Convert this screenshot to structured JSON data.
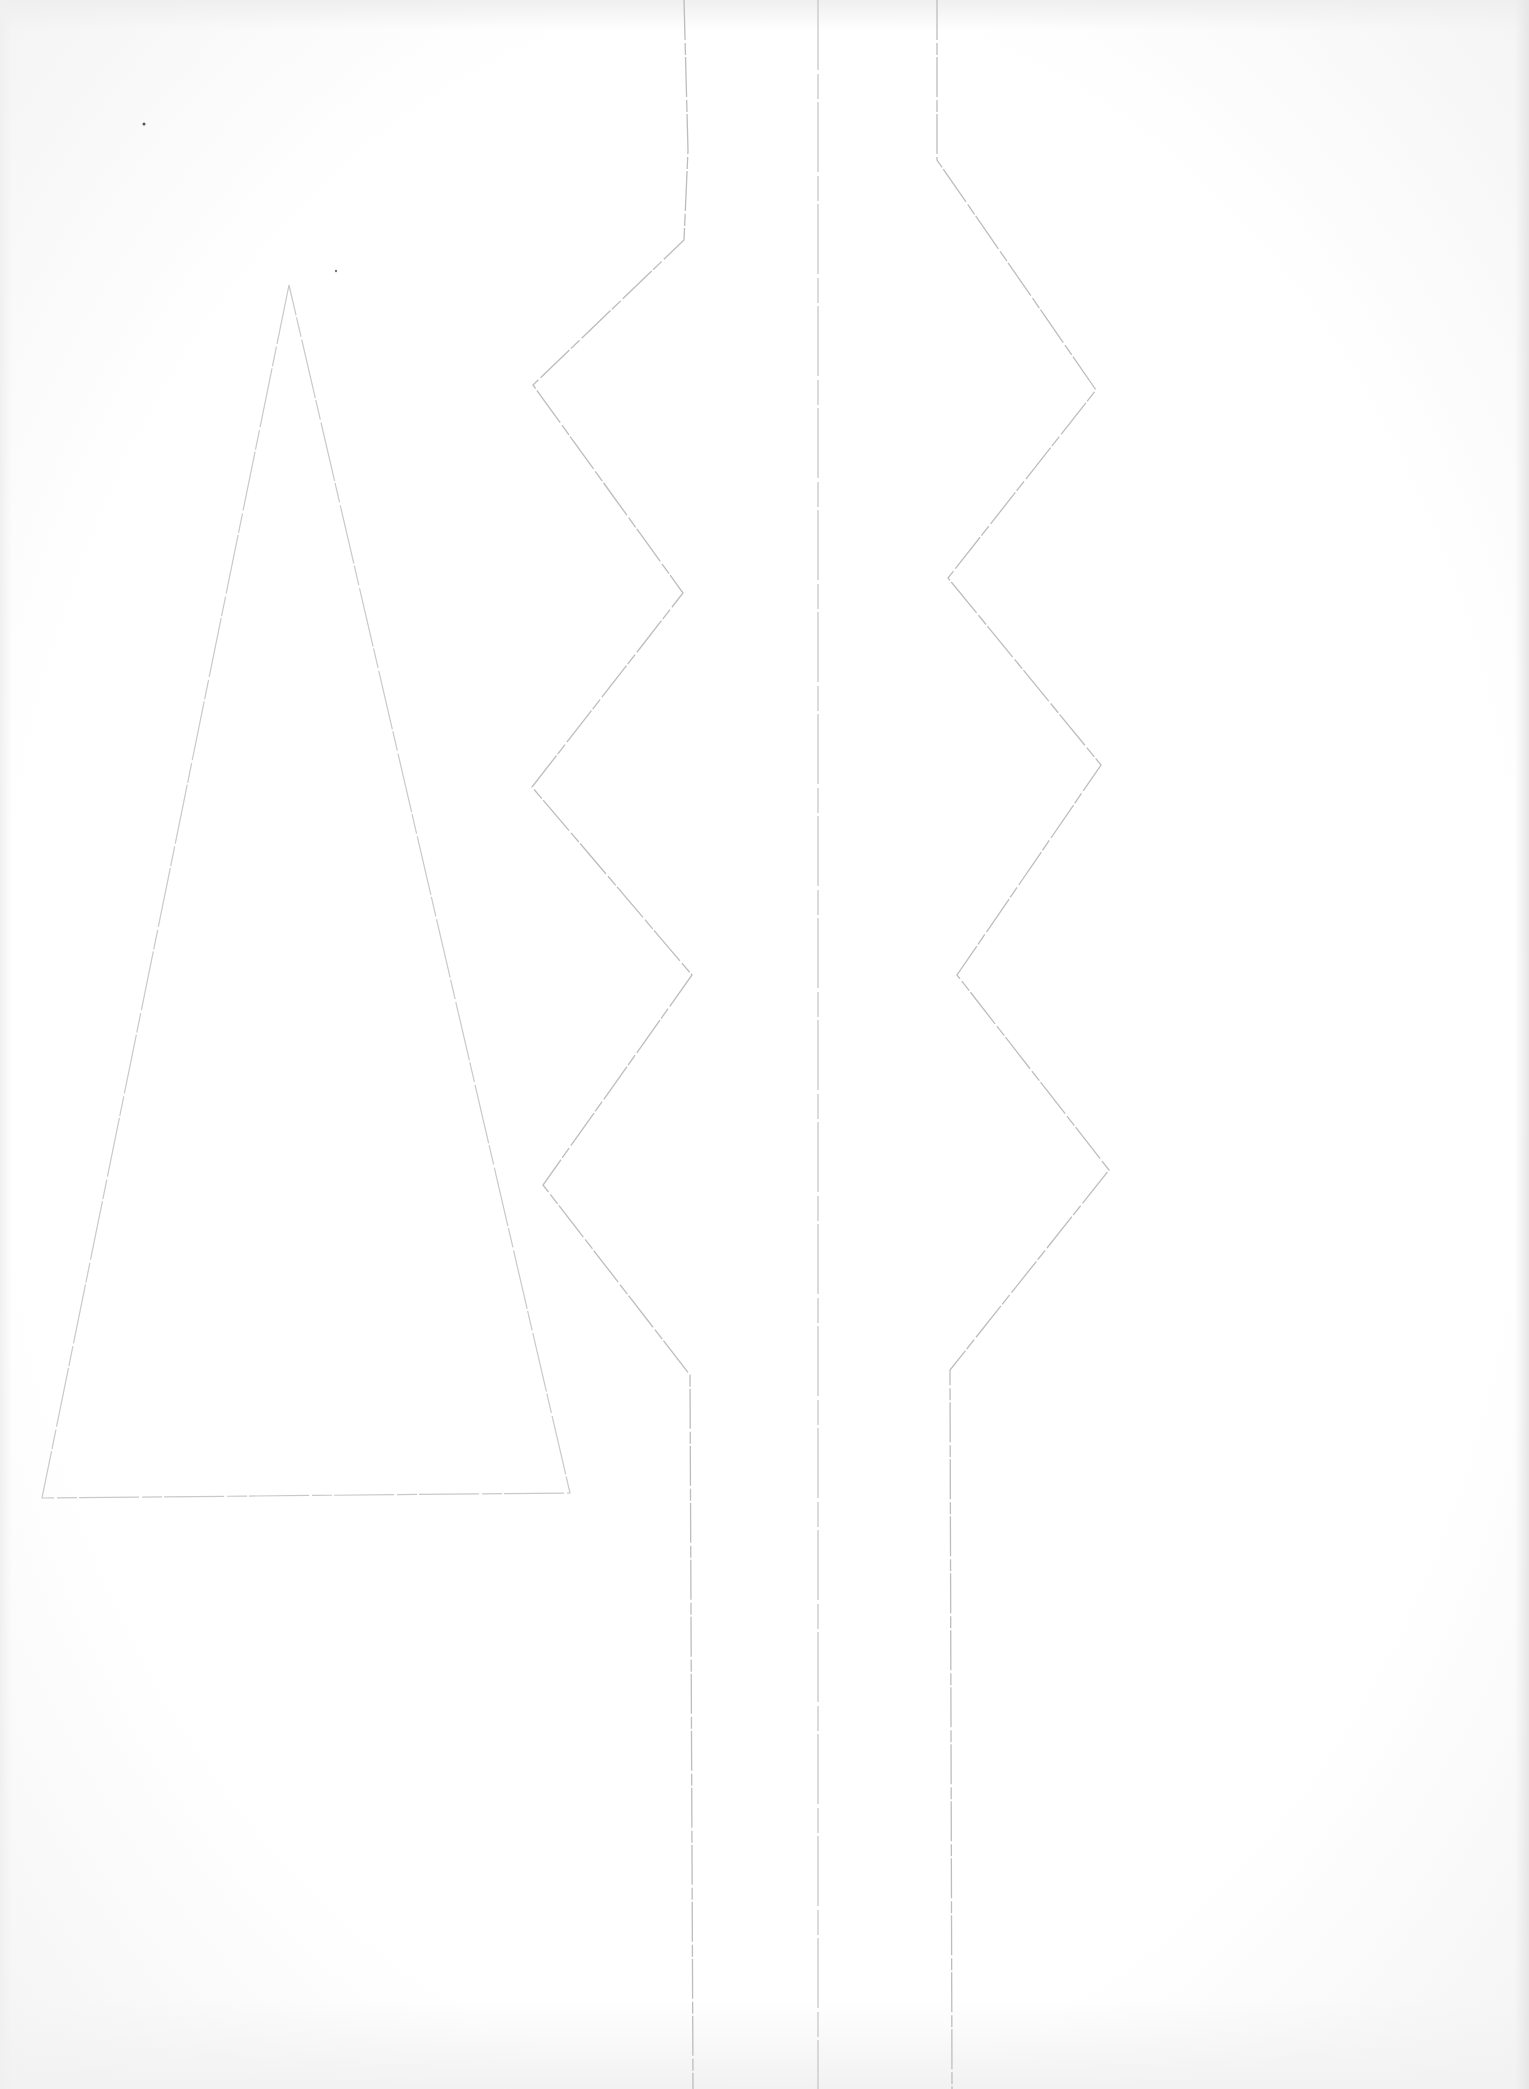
{
  "document": {
    "type": "scanned paper craft template",
    "paper_color": "#ffffff",
    "line_color": "#bdbdbd",
    "fold_line_color": "#c4c4c4"
  },
  "shapes": {
    "triangle": {
      "name": "tall triangle outline",
      "points": "289,285 42,1498 570,1493"
    },
    "zigzag_left": {
      "name": "left zigzag cut line",
      "points": "684,0 688,150 684,240 533,385 683,593 532,787 692,975 543,1185 690,1375 693,2089"
    },
    "zigzag_right": {
      "name": "right zigzag cut line",
      "points": "937,0 937,160 1096,390 948,578 1101,765 957,975 1109,1170 950,1370 952,2089"
    },
    "fold_line": {
      "name": "center fold line",
      "x1": "818",
      "y1": "0",
      "x2": "818",
      "y2": "2089"
    }
  }
}
